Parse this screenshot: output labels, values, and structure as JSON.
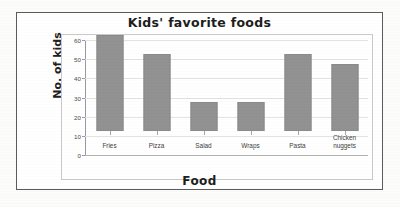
{
  "chart_data": {
    "type": "bar",
    "title": "Kids' favorite foods",
    "xlabel": "Food",
    "ylabel": "No. of kids",
    "categories": [
      "Fries",
      "Pizza",
      "Salad",
      "Wraps",
      "Pasta",
      "Chicken nuggets"
    ],
    "values": [
      50,
      40,
      15,
      15,
      40,
      35
    ],
    "ylim": [
      0,
      60
    ],
    "ytick_labels": [
      "0",
      "10",
      "20",
      "30",
      "40",
      "50",
      "60"
    ],
    "ytick_values": [
      0,
      10,
      20,
      30,
      40,
      50,
      60
    ],
    "grid": true,
    "legend": false,
    "bar_color": "#929292",
    "frame_color": "#5b5b5b",
    "plot_border_color": "#c9c9c9"
  },
  "figure": {
    "background": "#fcfcfb"
  }
}
